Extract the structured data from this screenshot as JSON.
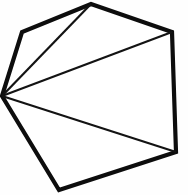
{
  "figure": {
    "name": "polygon-triangulation",
    "shape_label": "hexagon",
    "background_color": "#fefefe",
    "outline_color": "#0d0d0d",
    "diagonal_color": "#131313",
    "outline_width": 4.2,
    "diagonal_width": 2.2,
    "canvas": {
      "width": 188,
      "height": 195
    },
    "vertices": [
      {
        "id": "v1",
        "label": "fan-vertex-left",
        "x": 2,
        "y": 96
      },
      {
        "id": "v2",
        "label": "upper-left",
        "x": 22,
        "y": 32
      },
      {
        "id": "v3",
        "label": "top",
        "x": 91,
        "y": 4
      },
      {
        "id": "v4",
        "label": "upper-right",
        "x": 172,
        "y": 32
      },
      {
        "id": "v5",
        "label": "lower-right",
        "x": 176,
        "y": 152
      },
      {
        "id": "v6",
        "label": "bottom-left",
        "x": 59,
        "y": 190
      }
    ],
    "outline_points": "2,96 22,32 91,4 172,32 176,152 59,190",
    "diagonals": [
      {
        "id": "d1",
        "from": "v1",
        "to": "v3",
        "x1": 2,
        "y1": 96,
        "x2": 91,
        "y2": 4
      },
      {
        "id": "d2",
        "from": "v1",
        "to": "v4",
        "x1": 2,
        "y1": 96,
        "x2": 172,
        "y2": 32
      },
      {
        "id": "d3",
        "from": "v1",
        "to": "v5",
        "x1": 2,
        "y1": 96,
        "x2": 176,
        "y2": 152
      }
    ],
    "triangles": [
      {
        "id": "t1",
        "vertices": [
          "v1",
          "v2",
          "v3"
        ]
      },
      {
        "id": "t2",
        "vertices": [
          "v1",
          "v3",
          "v4"
        ]
      },
      {
        "id": "t3",
        "vertices": [
          "v1",
          "v4",
          "v5"
        ]
      },
      {
        "id": "t4",
        "vertices": [
          "v1",
          "v5",
          "v6"
        ]
      }
    ],
    "counts": {
      "sides": 6,
      "diagonals_drawn": 3,
      "triangles_formed": 4
    }
  }
}
